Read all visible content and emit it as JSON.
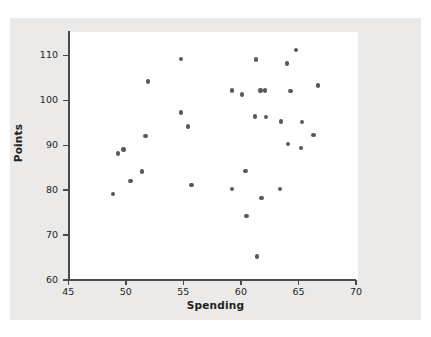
{
  "figure": {
    "background_color": "#eceae8",
    "plot_background_color": "#ffffff",
    "axis_color": "#4a4a4a",
    "marker_color": "#595959"
  },
  "chart_data": {
    "type": "scatter",
    "title": "",
    "xlabel": "Spending",
    "ylabel": "Points",
    "xlim": [
      45,
      70
    ],
    "ylim": [
      60,
      115
    ],
    "xticks": [
      45,
      50,
      55,
      60,
      65,
      70
    ],
    "yticks": [
      60,
      70,
      80,
      90,
      100,
      110
    ],
    "xtick_labels": [
      "45",
      "50",
      "55",
      "60",
      "65",
      "70"
    ],
    "ytick_labels": [
      "60",
      "70",
      "80",
      "90",
      "100",
      "110"
    ],
    "grid": false,
    "legend": null,
    "series": [
      {
        "name": "observations",
        "n": 33,
        "x": [
          48.9,
          49.3,
          49.8,
          50.4,
          51.4,
          51.7,
          51.9,
          54.8,
          54.8,
          55.4,
          55.7,
          59.2,
          59.2,
          60.1,
          60.4,
          60.5,
          61.2,
          61.3,
          61.7,
          61.8,
          62.1,
          62.2,
          63.4,
          63.5,
          64.0,
          64.1,
          64.3,
          64.8,
          65.2,
          65.3,
          66.3,
          66.7,
          61.4
        ],
        "y": [
          79.2,
          88.2,
          89.1,
          82.1,
          84.2,
          92.1,
          104.2,
          97.3,
          109.2,
          94.2,
          81.2,
          80.2,
          102.2,
          101.3,
          84.3,
          74.3,
          96.4,
          109.1,
          102.2,
          78.2,
          102.2,
          96.3,
          80.2,
          95.3,
          108.2,
          90.3,
          102.1,
          111.2,
          89.4,
          95.2,
          92.3,
          103.3,
          65.2
        ]
      }
    ],
    "points": [
      {
        "x": 48.9,
        "y": 79.2
      },
      {
        "x": 49.3,
        "y": 88.2
      },
      {
        "x": 49.8,
        "y": 89.1
      },
      {
        "x": 50.4,
        "y": 82.1
      },
      {
        "x": 51.4,
        "y": 84.2
      },
      {
        "x": 51.7,
        "y": 92.1
      },
      {
        "x": 51.9,
        "y": 104.2
      },
      {
        "x": 54.8,
        "y": 97.3
      },
      {
        "x": 54.8,
        "y": 109.2
      },
      {
        "x": 55.4,
        "y": 94.2
      },
      {
        "x": 55.7,
        "y": 81.2
      },
      {
        "x": 59.2,
        "y": 80.2
      },
      {
        "x": 59.2,
        "y": 102.2
      },
      {
        "x": 60.1,
        "y": 101.3
      },
      {
        "x": 60.4,
        "y": 84.3
      },
      {
        "x": 60.5,
        "y": 74.3
      },
      {
        "x": 61.2,
        "y": 96.4
      },
      {
        "x": 61.3,
        "y": 109.1
      },
      {
        "x": 61.4,
        "y": 65.2
      },
      {
        "x": 61.7,
        "y": 102.2
      },
      {
        "x": 61.8,
        "y": 78.2
      },
      {
        "x": 62.1,
        "y": 102.2
      },
      {
        "x": 62.2,
        "y": 96.3
      },
      {
        "x": 63.4,
        "y": 80.2
      },
      {
        "x": 63.5,
        "y": 95.3
      },
      {
        "x": 64.0,
        "y": 108.2
      },
      {
        "x": 64.1,
        "y": 90.3
      },
      {
        "x": 64.3,
        "y": 102.1
      },
      {
        "x": 64.8,
        "y": 111.2
      },
      {
        "x": 65.2,
        "y": 89.4
      },
      {
        "x": 65.3,
        "y": 95.2
      },
      {
        "x": 66.3,
        "y": 92.3
      },
      {
        "x": 66.7,
        "y": 103.3
      }
    ]
  }
}
